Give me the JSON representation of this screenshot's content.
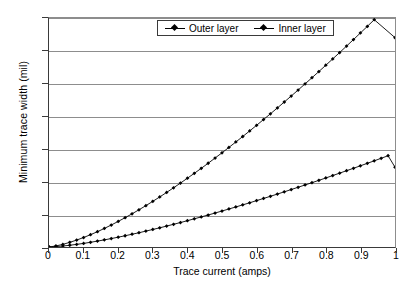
{
  "chart_data": {
    "type": "line",
    "title": "",
    "xlabel": "Trace current (amps)",
    "ylabel": "Minimum trace width (mil)",
    "xlim": [
      0,
      1
    ],
    "ylim": [
      0,
      35
    ],
    "xticks": [
      "0",
      "0.1",
      "0.2",
      "0.3",
      "0.4",
      "0.5",
      "0.6",
      "0.7",
      "0.8",
      "0.9",
      "1"
    ],
    "yticks": [
      "0",
      "5",
      "10",
      "15",
      "20",
      "25",
      "30",
      "35"
    ],
    "grid": "horizontal",
    "legend_position": "top-center",
    "marker": "diamond",
    "line_color": "#000000",
    "x": [
      0,
      0.02,
      0.04,
      0.06,
      0.08,
      0.1,
      0.12,
      0.14,
      0.16,
      0.18,
      0.2,
      0.22,
      0.24,
      0.26,
      0.28,
      0.3,
      0.32,
      0.34,
      0.36,
      0.38,
      0.4,
      0.42,
      0.44,
      0.46,
      0.48,
      0.5,
      0.52,
      0.54,
      0.56,
      0.58,
      0.6,
      0.62,
      0.64,
      0.66,
      0.68,
      0.7,
      0.72,
      0.74,
      0.76,
      0.78,
      0.8,
      0.82,
      0.84,
      0.86,
      0.88,
      0.9,
      0.92,
      0.94,
      0.96,
      0.98,
      1
    ],
    "series": [
      {
        "name": "Outer layer",
        "values": [
          0,
          0.06,
          0.15,
          0.27,
          0.4,
          0.55,
          0.72,
          0.9,
          1.09,
          1.29,
          1.5,
          1.72,
          1.95,
          2.18,
          2.43,
          2.68,
          2.93,
          3.2,
          3.47,
          3.74,
          4.02,
          4.31,
          4.6,
          4.89,
          5.19,
          5.5,
          5.81,
          6.12,
          6.44,
          6.76,
          7.09,
          7.42,
          7.75,
          8.09,
          8.43,
          8.78,
          9.13,
          9.48,
          9.83,
          10.19,
          10.55,
          10.92,
          11.29,
          11.66,
          12.03,
          12.41,
          12.79,
          13.17,
          13.56,
          13.95,
          12.2
        ]
      },
      {
        "name": "Inner layer",
        "values": [
          0,
          0.16,
          0.4,
          0.71,
          1.06,
          1.45,
          1.88,
          2.34,
          2.84,
          3.36,
          3.91,
          4.48,
          5.07,
          5.69,
          6.32,
          6.98,
          7.65,
          8.34,
          9.05,
          9.77,
          10.51,
          11.26,
          12.02,
          12.8,
          13.6,
          14.4,
          15.22,
          16.05,
          16.89,
          17.74,
          18.6,
          19.48,
          20.36,
          21.25,
          22.16,
          23.07,
          23.99,
          24.93,
          25.87,
          26.82,
          27.78,
          28.75,
          29.72,
          30.71,
          31.7,
          32.71,
          33.72,
          34.74,
          35.76,
          36.8,
          32.0
        ]
      }
    ]
  },
  "legend": {
    "entries": [
      {
        "label": "Outer layer"
      },
      {
        "label": "Inner layer"
      }
    ]
  },
  "caption": {
    "text": ""
  }
}
